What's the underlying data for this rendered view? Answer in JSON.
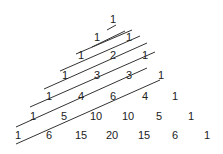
{
  "rows": [
    [
      "1"
    ],
    [
      "1",
      "1"
    ],
    [
      "1",
      "2",
      "1"
    ],
    [
      "1",
      "3",
      "3",
      "1"
    ],
    [
      "1",
      "4",
      "6",
      "4",
      "1"
    ],
    [
      "1",
      "5",
      "10",
      "10",
      "5",
      "1"
    ],
    [
      "1",
      "6",
      "15",
      "20",
      "15",
      "6",
      "1"
    ]
  ],
  "line_color": "#333333",
  "text_color": "#222222"
}
